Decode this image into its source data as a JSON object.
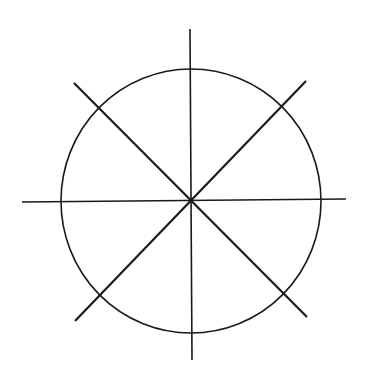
{
  "diagram": {
    "stroke_color": "#1a1a1a",
    "background": "#ffffff",
    "circle": {
      "cx": 191,
      "cy": 201,
      "rx": 130,
      "ry": 132
    },
    "lines": [
      {
        "name": "vertical",
        "x1": 190,
        "y1": 29,
        "x2": 192,
        "y2": 360
      },
      {
        "name": "horizontal",
        "x1": 22,
        "y1": 202,
        "x2": 346,
        "y2": 199
      },
      {
        "name": "diagonal-nw-se",
        "x1": 74,
        "y1": 83,
        "x2": 307,
        "y2": 317
      },
      {
        "name": "diagonal-ne-sw",
        "x1": 306,
        "y1": 81,
        "x2": 75,
        "y2": 321
      }
    ]
  }
}
